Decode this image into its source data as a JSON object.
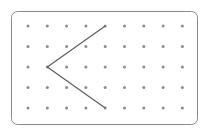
{
  "diagram": {
    "type": "geoboard-dot-grid",
    "columns": 9,
    "rows": 5,
    "frame_color": "#8a8a8a",
    "dot_color": "#8c8c8c",
    "line_color": "#5a5a5a",
    "segments": [
      {
        "from": [
          4,
          0
        ],
        "to": [
          1,
          2
        ]
      },
      {
        "from": [
          1,
          2
        ],
        "to": [
          4,
          4
        ]
      }
    ]
  }
}
